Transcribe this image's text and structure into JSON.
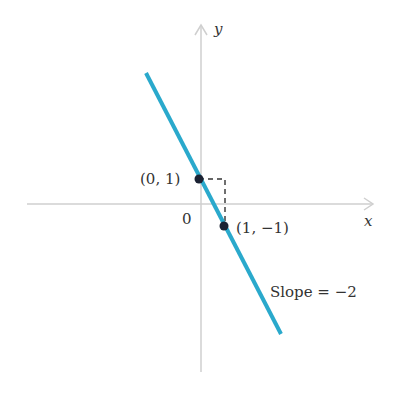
{
  "diagram": {
    "type": "coordinate-line-plot",
    "axes": {
      "x_label": "x",
      "y_label": "y",
      "origin_label": "0",
      "axis_color": "#c8c8c8"
    },
    "line": {
      "equation": "y = -2x + 1",
      "color": "#2aa9cc",
      "slope_label": "Slope = −2"
    },
    "points": [
      {
        "label": "(0, 1)",
        "x": 0,
        "y": 1
      },
      {
        "label": "(1, −1)",
        "x": 1,
        "y": -1
      }
    ],
    "rise_run_guide": {
      "style": "dashed",
      "color": "#333333"
    }
  }
}
